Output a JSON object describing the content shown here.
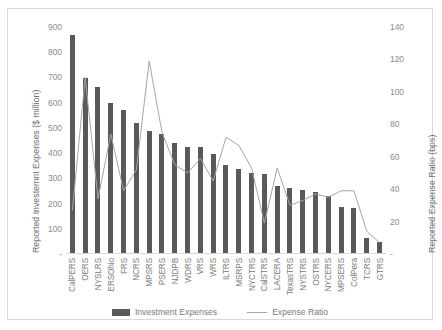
{
  "chart_data": {
    "type": "bar",
    "title": "",
    "subtitle": "",
    "xlabel": "",
    "ylabel": "Reported Investemnt Expenses ($ million)",
    "y2label": "Reported Expense Ratio (bps)",
    "ylim": [
      0,
      900
    ],
    "y2lim": [
      0,
      140
    ],
    "y_ticks": [
      "900",
      "800",
      "700",
      "600",
      "500",
      "400",
      "300",
      "200",
      "100",
      "-"
    ],
    "y2_ticks": [
      "140",
      "120",
      "100",
      "80",
      "60",
      "40",
      "20",
      "-"
    ],
    "grid": false,
    "legend_position": "bottom",
    "categories": [
      "CalPERS",
      "OERS",
      "NYSLRS",
      "ERSOhio",
      "FRS",
      "NCRS",
      "MPSRS",
      "PSERS",
      "NJDPB",
      "WDRS",
      "VRS",
      "WRS",
      "ILTRS",
      "MSRPS",
      "NYCTRS",
      "CalSTRS",
      "LACERA",
      "TexasTRS",
      "NYSTRS",
      "OSTRS",
      "NYCERS",
      "MPSERS",
      "ColPera",
      "TCRS",
      "GTRS"
    ],
    "series": [
      {
        "name": "Investment Expenses",
        "type": "bar",
        "axis": "left",
        "units": "$ million",
        "color": "#595959",
        "values": [
          868,
          698,
          663,
          600,
          571,
          521,
          489,
          476,
          439,
          426,
          426,
          396,
          353,
          339,
          320,
          318,
          268,
          263,
          253,
          245,
          232,
          187,
          184,
          64,
          48
        ]
      },
      {
        "name": "Expense Ratio",
        "type": "line",
        "axis": "right",
        "units": "bps",
        "color": "#a6a6a6",
        "values": [
          27,
          109,
          34,
          74,
          39,
          52,
          119,
          75,
          55,
          50,
          59,
          45,
          72,
          67,
          53,
          19,
          53,
          30,
          33,
          37,
          35,
          39,
          39,
          14,
          7
        ]
      }
    ],
    "legend": [
      {
        "label": "Investment Expenses",
        "marker": "bar",
        "color": "#595959"
      },
      {
        "label": "Expense Ratio",
        "marker": "line",
        "color": "#a6a6a6"
      }
    ]
  }
}
